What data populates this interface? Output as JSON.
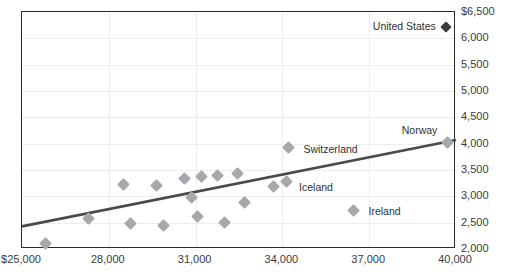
{
  "chart_data": {
    "type": "scatter",
    "title": "",
    "xlabel": "",
    "ylabel": "",
    "xlim": [
      25000,
      40000
    ],
    "ylim": [
      2000,
      6500
    ],
    "xticks": [
      "$25,000",
      "28,000",
      "31,000",
      "34,000",
      "37,000",
      "40,000"
    ],
    "xtick_values": [
      25000,
      28000,
      31000,
      34000,
      37000,
      40000
    ],
    "yticks": [
      "$6,500",
      "6,000",
      "5,500",
      "5,000",
      "4,500",
      "4,000",
      "3,500",
      "3,000",
      "2,500",
      "2,000"
    ],
    "ytick_values": [
      6500,
      6000,
      5500,
      5000,
      4500,
      4000,
      3500,
      3000,
      2500,
      2000
    ],
    "grid": "both",
    "y_axis_position": "right",
    "legend": "none",
    "marker_color": "#a8a8ac",
    "highlight_marker_color": "#3b3b3f",
    "trendline_color": "#4a4a4d",
    "axis_color": "#2a2a2a",
    "grid_color": "#ededf0",
    "points": [
      {
        "label": "",
        "x": 25800,
        "y": 2100
      },
      {
        "label": "",
        "x": 27300,
        "y": 2580
      },
      {
        "label": "",
        "x": 28500,
        "y": 3230
      },
      {
        "label": "",
        "x": 28750,
        "y": 2480
      },
      {
        "label": "",
        "x": 29650,
        "y": 3200
      },
      {
        "label": "",
        "x": 29900,
        "y": 2440
      },
      {
        "label": "",
        "x": 30600,
        "y": 3330
      },
      {
        "label": "",
        "x": 30850,
        "y": 2980
      },
      {
        "label": "",
        "x": 31050,
        "y": 2620
      },
      {
        "label": "",
        "x": 31200,
        "y": 3380
      },
      {
        "label": "",
        "x": 31750,
        "y": 3390
      },
      {
        "label": "",
        "x": 32000,
        "y": 2500
      },
      {
        "label": "",
        "x": 32450,
        "y": 3430
      },
      {
        "label": "",
        "x": 32700,
        "y": 2880
      },
      {
        "label": "",
        "x": 33700,
        "y": 3180
      },
      {
        "label": "Switzerland",
        "x": 34200,
        "y": 3930
      },
      {
        "label": "Iceland",
        "x": 34150,
        "y": 3290
      },
      {
        "label": "Ireland",
        "x": 36450,
        "y": 2740
      },
      {
        "label": "Norway",
        "x": 39700,
        "y": 4030
      },
      {
        "label": "United States",
        "x": 39650,
        "y": 6220,
        "highlight": true
      }
    ],
    "trendline": {
      "x0": 25000,
      "y0": 2430,
      "x1": 40000,
      "y1": 4070
    },
    "point_labels": [
      {
        "text": "United States",
        "x": 39650,
        "y": 6220,
        "anchor": "right"
      },
      {
        "text": "Norway",
        "x": 39700,
        "y": 4250,
        "anchor": "right"
      },
      {
        "text": "Switzerland",
        "x": 34450,
        "y": 3880,
        "anchor": "left"
      },
      {
        "text": "Iceland",
        "x": 34300,
        "y": 3150,
        "anchor": "left"
      },
      {
        "text": "Ireland",
        "x": 36700,
        "y": 2700,
        "anchor": "left"
      }
    ]
  }
}
